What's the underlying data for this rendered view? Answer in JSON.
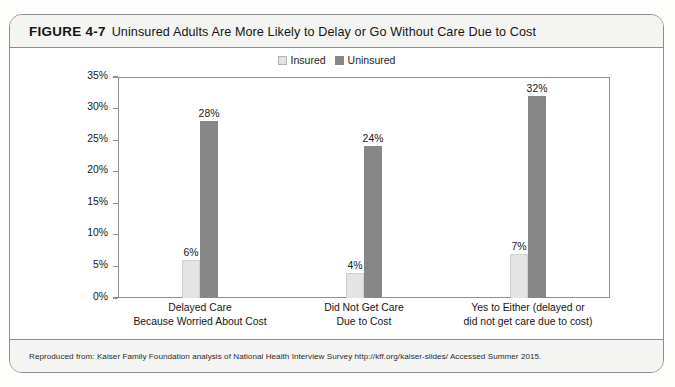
{
  "figure": {
    "number": "FIGURE 4-7",
    "caption": "Uninsured Adults Are More Likely to Delay or Go Without Care Due to Cost",
    "source": "Reproduced from: Kaiser Family Foundation analysis of National Health Interview Survey http://kff.org/kaiser-slides/ Accessed Summer 2015."
  },
  "colors": {
    "insured": "#e4e4e4",
    "uninsured": "#878787",
    "frame": "#8d8d8d",
    "band": "#f4f4f2"
  },
  "chart_data": {
    "type": "bar",
    "title": "Uninsured Adults Are More Likely to Delay or Go Without Care Due to Cost",
    "xlabel": "",
    "ylabel": "",
    "ylim": [
      0,
      35
    ],
    "grid": false,
    "legend_position": "top-center",
    "categories": [
      "Delayed Care\nBecause Worried About Cost",
      "Did Not Get Care\nDue to Cost",
      "Yes to Either (delayed or\ndid not get care due to cost)"
    ],
    "category_lines": [
      [
        "Delayed Care",
        "Because Worried About Cost"
      ],
      [
        "Did Not Get Care",
        "Due to Cost"
      ],
      [
        "Yes to Either (delayed or",
        "did not get care due to cost)"
      ]
    ],
    "series": [
      {
        "name": "Insured",
        "values": [
          6,
          4,
          7
        ],
        "labels": [
          "6%",
          "4%",
          "7%"
        ]
      },
      {
        "name": "Uninsured",
        "values": [
          28,
          24,
          32
        ],
        "labels": [
          "28%",
          "24%",
          "32%"
        ]
      }
    ],
    "yticks": [
      0,
      5,
      10,
      15,
      20,
      25,
      30,
      35
    ],
    "ytick_labels": [
      "0%",
      "5%",
      "10%",
      "15%",
      "20%",
      "25%",
      "30%",
      "35%"
    ]
  }
}
